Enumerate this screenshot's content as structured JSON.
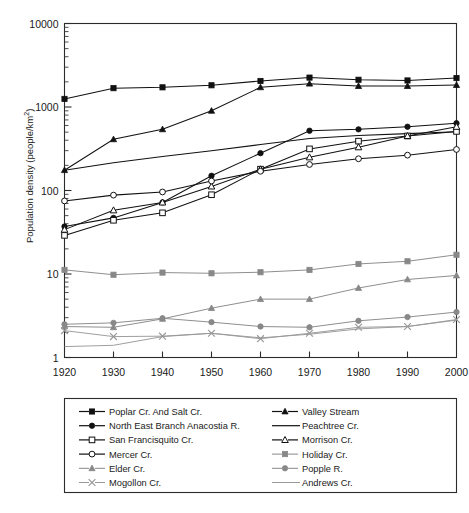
{
  "chart_data": {
    "type": "line",
    "title": "",
    "xlabel": "",
    "ylabel": "Population density (people/km2)",
    "ylabel_display": "Population density (people/km",
    "ylabel_superscript": "2",
    "ylabel_suffix": ")",
    "yscale": "log",
    "ylim": [
      1,
      10000
    ],
    "ytick_labels": [
      "10000",
      "1000",
      "100",
      "10",
      "1"
    ],
    "ytick_values": [
      10000,
      1000,
      100,
      10,
      1
    ],
    "xlim": [
      1920,
      2000
    ],
    "xtick_labels": [
      "1920",
      "1930",
      "1940",
      "1950",
      "1960",
      "1970",
      "1980",
      "1990",
      "2000"
    ],
    "x": [
      1920,
      1930,
      1940,
      1950,
      1960,
      1970,
      1980,
      1990,
      2000
    ],
    "grid": false,
    "legend_position": "below",
    "series": [
      {
        "name": "Poplar Cr. And Salt Cr.",
        "marker": "filled-square",
        "color": "#111111",
        "values": [
          1250,
          1680,
          1720,
          1820,
          2050,
          2250,
          2120,
          2080,
          2220
        ]
      },
      {
        "name": "Valley Stream",
        "marker": "filled-triangle",
        "color": "#111111",
        "values": [
          175,
          410,
          540,
          900,
          1720,
          1900,
          1780,
          1780,
          1830
        ]
      },
      {
        "name": "North East Branch Anacostia R.",
        "marker": "filled-circle",
        "color": "#111111",
        "values": [
          37,
          47,
          72,
          150,
          280,
          520,
          540,
          580,
          640
        ]
      },
      {
        "name": "Peachtree Cr.",
        "marker": "none",
        "color": "#111111",
        "values": [
          175,
          215,
          255,
          300,
          355,
          420,
          455,
          480,
          505
        ]
      },
      {
        "name": "San Francisquito Cr.",
        "marker": "open-square",
        "color": "#111111",
        "values": [
          29,
          44,
          54,
          89,
          180,
          315,
          390,
          450,
          510
        ]
      },
      {
        "name": "Morrison Cr.",
        "marker": "open-triangle",
        "color": "#111111",
        "values": [
          34,
          58,
          72,
          112,
          180,
          250,
          330,
          450,
          580
        ]
      },
      {
        "name": "Mercer Cr.",
        "marker": "open-circle",
        "color": "#111111",
        "values": [
          75,
          88,
          96,
          130,
          170,
          205,
          240,
          265,
          310
        ]
      },
      {
        "name": "Holiday Cr.",
        "marker": "filled-square-gray",
        "color": "#888888",
        "values": [
          11.2,
          9.8,
          10.4,
          10.2,
          10.5,
          11.2,
          13.2,
          14.2,
          17.0
        ]
      },
      {
        "name": "Elder Cr.",
        "marker": "filled-triangle-gray",
        "color": "#888888",
        "values": [
          2.35,
          2.3,
          2.9,
          3.9,
          5.0,
          5.0,
          6.8,
          8.6,
          9.6
        ]
      },
      {
        "name": "Popple R.",
        "marker": "filled-circle-gray",
        "color": "#888888",
        "values": [
          2.5,
          2.6,
          2.95,
          2.65,
          2.35,
          2.3,
          2.75,
          3.05,
          3.5
        ]
      },
      {
        "name": "Mogollon Cr.",
        "marker": "cross-gray",
        "color": "#999999",
        "values": [
          2.1,
          1.78,
          1.8,
          1.95,
          1.68,
          1.95,
          2.3,
          2.35,
          2.85
        ]
      },
      {
        "name": "Andrews Cr.",
        "marker": "none-gray",
        "color": "#999999",
        "values": [
          1.35,
          1.4,
          1.78,
          1.95,
          1.72,
          1.9,
          2.2,
          2.35,
          2.8
        ]
      }
    ]
  },
  "legend": {
    "column_left": [
      {
        "label": "Poplar Cr. And Salt Cr.",
        "marker": "filled-square",
        "color": "#111111"
      },
      {
        "label": "North East Branch Anacostia R.",
        "marker": "filled-circle",
        "color": "#111111"
      },
      {
        "label": "San Francisquito Cr.",
        "marker": "open-square",
        "color": "#111111"
      },
      {
        "label": "Mercer Cr.",
        "marker": "open-circle",
        "color": "#111111"
      },
      {
        "label": "Elder Cr.",
        "marker": "filled-triangle-gray",
        "color": "#888888"
      },
      {
        "label": "Mogollon Cr.",
        "marker": "cross-gray",
        "color": "#999999"
      }
    ],
    "column_right": [
      {
        "label": "Valley Stream",
        "marker": "filled-triangle",
        "color": "#111111"
      },
      {
        "label": "Peachtree Cr.",
        "marker": "none",
        "color": "#111111"
      },
      {
        "label": "Morrison Cr.",
        "marker": "open-triangle",
        "color": "#111111"
      },
      {
        "label": "Holiday Cr.",
        "marker": "filled-square-gray",
        "color": "#888888"
      },
      {
        "label": "Popple R.",
        "marker": "filled-circle-gray",
        "color": "#888888"
      },
      {
        "label": "Andrews Cr.",
        "marker": "none-gray",
        "color": "#999999"
      }
    ]
  }
}
